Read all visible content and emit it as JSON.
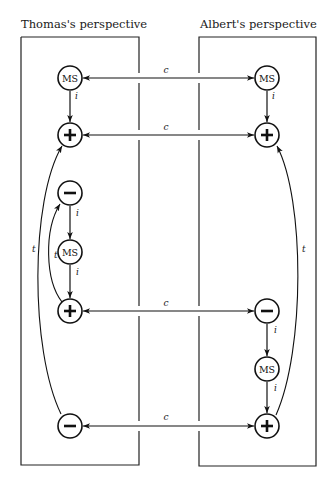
{
  "panels": {
    "left": {
      "title": "Thomas's perspective"
    },
    "right": {
      "title": "Albert's perspective"
    }
  },
  "edge_labels": {
    "communication": "c",
    "internal": "i",
    "temporal": "t"
  },
  "node_labels": {
    "ms": "MS",
    "plus": "+",
    "minus": "−"
  },
  "nodes": {
    "left": [
      {
        "id": "L1",
        "type": "MS",
        "y": 78
      },
      {
        "id": "L2",
        "type": "+",
        "y": 135
      },
      {
        "id": "L3",
        "type": "−",
        "y": 193
      },
      {
        "id": "L4",
        "type": "MS",
        "y": 252
      },
      {
        "id": "L5",
        "type": "+",
        "y": 311
      },
      {
        "id": "L6",
        "type": "−",
        "y": 426
      }
    ],
    "right": [
      {
        "id": "R1",
        "type": "MS",
        "y": 78
      },
      {
        "id": "R2",
        "type": "+",
        "y": 135
      },
      {
        "id": "R3",
        "type": "−",
        "y": 311
      },
      {
        "id": "R4",
        "type": "MS",
        "y": 369
      },
      {
        "id": "R5",
        "type": "+",
        "y": 426
      }
    ]
  },
  "edges": [
    {
      "from": "L1",
      "to": "R1",
      "label": "c",
      "bidirectional": true
    },
    {
      "from": "L2",
      "to": "R2",
      "label": "c",
      "bidirectional": true
    },
    {
      "from": "L5",
      "to": "R3",
      "label": "c",
      "bidirectional": true
    },
    {
      "from": "L6",
      "to": "R5",
      "label": "c",
      "bidirectional": true
    },
    {
      "from": "L1",
      "to": "L2",
      "label": "i"
    },
    {
      "from": "L3",
      "to": "L4",
      "label": "i"
    },
    {
      "from": "L4",
      "to": "L5",
      "label": "i"
    },
    {
      "from": "R1",
      "to": "R2",
      "label": "i"
    },
    {
      "from": "R3",
      "to": "R4",
      "label": "i"
    },
    {
      "from": "R4",
      "to": "R5",
      "label": "i"
    },
    {
      "from": "L5",
      "to": "L3",
      "label": "t"
    },
    {
      "from": "L6",
      "to": "L2",
      "label": "t"
    },
    {
      "from": "R5",
      "to": "R2",
      "label": "t"
    }
  ]
}
